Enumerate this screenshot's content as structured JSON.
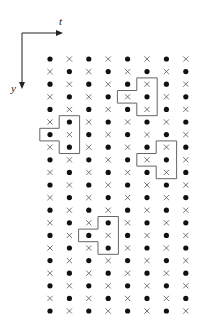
{
  "diagram": {
    "axes": {
      "horizontal_label": "t",
      "vertical_label": "y"
    },
    "grid": {
      "columns": 8,
      "rows": 21,
      "origin_x": 50,
      "origin_y": 59,
      "dx": 19.4,
      "dy": 12.6,
      "pattern": "checkerboard: dot when (row+col) even, cross otherwise",
      "dot_symbol": "filled-circle",
      "cross_symbol": "x"
    },
    "shapes": [
      {
        "name": "shape-top",
        "stem_col": 5,
        "stem_rows": [
          2,
          3,
          4
        ],
        "side_col": 4,
        "side_row": 3
      },
      {
        "name": "shape-left",
        "stem_col": 1,
        "stem_rows": [
          5,
          6,
          7
        ],
        "side_col": 0,
        "side_row": 6
      },
      {
        "name": "shape-right",
        "stem_col": 6,
        "stem_rows": [
          7,
          8,
          9
        ],
        "side_col": 5,
        "side_row": 8
      },
      {
        "name": "shape-bottom",
        "stem_col": 3,
        "stem_rows": [
          13,
          14,
          15
        ],
        "side_col": 2,
        "side_row": 14
      }
    ],
    "colors": {
      "dot": "#111111",
      "cross": "#555555",
      "outline": "#666666",
      "axis": "#222222"
    }
  }
}
